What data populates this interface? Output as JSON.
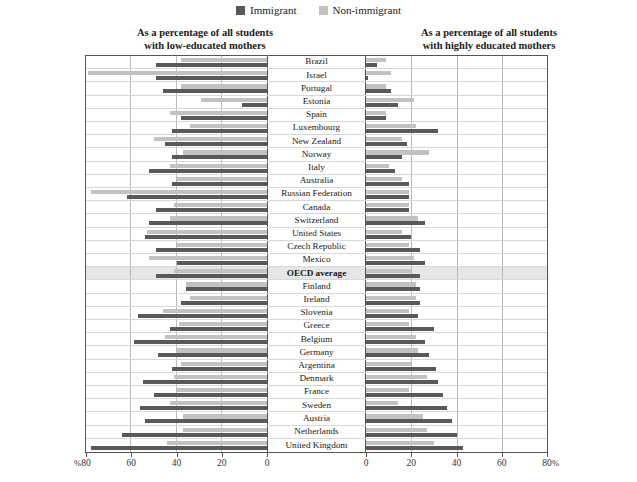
{
  "legend": {
    "items": [
      {
        "label": "Immigrant",
        "color": "#595959",
        "key": "immigrant"
      },
      {
        "label": "Non-immigrant",
        "color": "#c2c2c2",
        "key": "non_immigrant"
      }
    ]
  },
  "headings": {
    "left_line1": "As a percentage of all students",
    "left_line2": "with low-educated mothers",
    "right_line1": "As a percentage of all students",
    "right_line2": "with highly educated mothers"
  },
  "axes": {
    "left": {
      "ticks": [
        80,
        60,
        40,
        20,
        0
      ],
      "unit": "%",
      "unit_side": "left",
      "min": 0,
      "max": 80,
      "direction": "right-to-left"
    },
    "right": {
      "ticks": [
        0,
        20,
        40,
        60,
        80
      ],
      "unit": "%",
      "unit_side": "right",
      "min": 0,
      "max": 80,
      "direction": "left-to-right"
    }
  },
  "chart_data": {
    "type": "bar",
    "title": "",
    "subtitle": "",
    "orientation": "horizontal",
    "layout": "back-to-back paired panels with centre label column",
    "grid": true,
    "legend_position": "top-center",
    "panels": [
      {
        "name": "low_educated_mothers",
        "title": "As a percentage of all students with low-educated mothers",
        "xlabel": "%",
        "xlim": [
          0,
          80
        ],
        "ticks": [
          80,
          60,
          40,
          20,
          0
        ]
      },
      {
        "name": "highly_educated_mothers",
        "title": "As a percentage of all students with highly educated mothers",
        "xlabel": "%",
        "xlim": [
          0,
          80
        ],
        "ticks": [
          0,
          20,
          40,
          60,
          80
        ]
      }
    ],
    "series": [
      {
        "name": "Immigrant",
        "color": "#595959"
      },
      {
        "name": "Non-immigrant",
        "color": "#c2c2c2"
      }
    ],
    "categories": [
      "Brazil",
      "Israel",
      "Portugal",
      "Estonia",
      "Spain",
      "Luxembourg",
      "New Zealand",
      "Norway",
      "Italy",
      "Australia",
      "Russian Federation",
      "Canada",
      "Switzerland",
      "United States",
      "Czech Republic",
      "Mexico",
      "OECD average",
      "Finland",
      "Ireland",
      "Slovenia",
      "Greece",
      "Belgium",
      "Germany",
      "Argentina",
      "Denmark",
      "France",
      "Sweden",
      "Austria",
      "Netherlands",
      "United Kingdom"
    ],
    "rows": [
      {
        "category": "Brazil",
        "highlight": false,
        "low_immigrant": 49,
        "low_non_immigrant": 38,
        "high_immigrant": 5,
        "high_non_immigrant": 9
      },
      {
        "category": "Israel",
        "highlight": false,
        "low_immigrant": 49,
        "low_non_immigrant": 79,
        "high_immigrant": 1,
        "high_non_immigrant": 11
      },
      {
        "category": "Portugal",
        "highlight": false,
        "low_immigrant": 46,
        "low_non_immigrant": 38,
        "high_immigrant": 11,
        "high_non_immigrant": 9
      },
      {
        "category": "Estonia",
        "highlight": false,
        "low_immigrant": 11,
        "low_non_immigrant": 29,
        "high_immigrant": 14,
        "high_non_immigrant": 21
      },
      {
        "category": "Spain",
        "highlight": false,
        "low_immigrant": 38,
        "low_non_immigrant": 43,
        "high_immigrant": 9,
        "high_non_immigrant": 9
      },
      {
        "category": "Luxembourg",
        "highlight": false,
        "low_immigrant": 42,
        "low_non_immigrant": 34,
        "high_immigrant": 32,
        "high_non_immigrant": 22
      },
      {
        "category": "New Zealand",
        "highlight": false,
        "low_immigrant": 45,
        "low_non_immigrant": 50,
        "high_immigrant": 18,
        "high_non_immigrant": 16
      },
      {
        "category": "Norway",
        "highlight": false,
        "low_immigrant": 42,
        "low_non_immigrant": 37,
        "high_immigrant": 16,
        "high_non_immigrant": 28
      },
      {
        "category": "Italy",
        "highlight": false,
        "low_immigrant": 52,
        "low_non_immigrant": 43,
        "high_immigrant": 13,
        "high_non_immigrant": 10
      },
      {
        "category": "Australia",
        "highlight": false,
        "low_immigrant": 42,
        "low_non_immigrant": 40,
        "high_immigrant": 19,
        "high_non_immigrant": 16
      },
      {
        "category": "Russian Federation",
        "highlight": false,
        "low_immigrant": 62,
        "low_non_immigrant": 78,
        "high_immigrant": 19,
        "high_non_immigrant": 19
      },
      {
        "category": "Canada",
        "highlight": false,
        "low_immigrant": 49,
        "low_non_immigrant": 41,
        "high_immigrant": 19,
        "high_non_immigrant": 19
      },
      {
        "category": "Switzerland",
        "highlight": false,
        "low_immigrant": 52,
        "low_non_immigrant": 43,
        "high_immigrant": 26,
        "high_non_immigrant": 23
      },
      {
        "category": "United States",
        "highlight": false,
        "low_immigrant": 54,
        "low_non_immigrant": 53,
        "high_immigrant": 20,
        "high_non_immigrant": 16
      },
      {
        "category": "Czech Republic",
        "highlight": false,
        "low_immigrant": 49,
        "low_non_immigrant": 40,
        "high_immigrant": 24,
        "high_non_immigrant": 19
      },
      {
        "category": "Mexico",
        "highlight": false,
        "low_immigrant": 40,
        "low_non_immigrant": 52,
        "high_immigrant": 26,
        "high_non_immigrant": 21
      },
      {
        "category": "OECD average",
        "highlight": true,
        "low_immigrant": 49,
        "low_non_immigrant": 41,
        "high_immigrant": 24,
        "high_non_immigrant": 20
      },
      {
        "category": "Finland",
        "highlight": false,
        "low_immigrant": 36,
        "low_non_immigrant": 36,
        "high_immigrant": 24,
        "high_non_immigrant": 22
      },
      {
        "category": "Ireland",
        "highlight": false,
        "low_immigrant": 38,
        "low_non_immigrant": 34,
        "high_immigrant": 24,
        "high_non_immigrant": 22
      },
      {
        "category": "Slovenia",
        "highlight": false,
        "low_immigrant": 57,
        "low_non_immigrant": 46,
        "high_immigrant": 23,
        "high_non_immigrant": 19
      },
      {
        "category": "Greece",
        "highlight": false,
        "low_immigrant": 43,
        "low_non_immigrant": 39,
        "high_immigrant": 30,
        "high_non_immigrant": 19
      },
      {
        "category": "Belgium",
        "highlight": false,
        "low_immigrant": 59,
        "low_non_immigrant": 45,
        "high_immigrant": 26,
        "high_non_immigrant": 22
      },
      {
        "category": "Germany",
        "highlight": false,
        "low_immigrant": 48,
        "low_non_immigrant": 40,
        "high_immigrant": 28,
        "high_non_immigrant": 23
      },
      {
        "category": "Argentina",
        "highlight": false,
        "low_immigrant": 42,
        "low_non_immigrant": 38,
        "high_immigrant": 31,
        "high_non_immigrant": 20
      },
      {
        "category": "Denmark",
        "highlight": false,
        "low_immigrant": 55,
        "low_non_immigrant": 41,
        "high_immigrant": 32,
        "high_non_immigrant": 27
      },
      {
        "category": "France",
        "highlight": false,
        "low_immigrant": 50,
        "low_non_immigrant": 40,
        "high_immigrant": 34,
        "high_non_immigrant": 19
      },
      {
        "category": "Sweden",
        "highlight": false,
        "low_immigrant": 56,
        "low_non_immigrant": 43,
        "high_immigrant": 36,
        "high_non_immigrant": 14
      },
      {
        "category": "Austria",
        "highlight": false,
        "low_immigrant": 54,
        "low_non_immigrant": 37,
        "high_immigrant": 38,
        "high_non_immigrant": 25
      },
      {
        "category": "Netherlands",
        "highlight": false,
        "low_immigrant": 64,
        "low_non_immigrant": 37,
        "high_immigrant": 40,
        "high_non_immigrant": 27
      },
      {
        "category": "United Kingdom",
        "highlight": false,
        "low_immigrant": 78,
        "low_non_immigrant": 44,
        "high_immigrant": 43,
        "high_non_immigrant": 30
      }
    ]
  }
}
